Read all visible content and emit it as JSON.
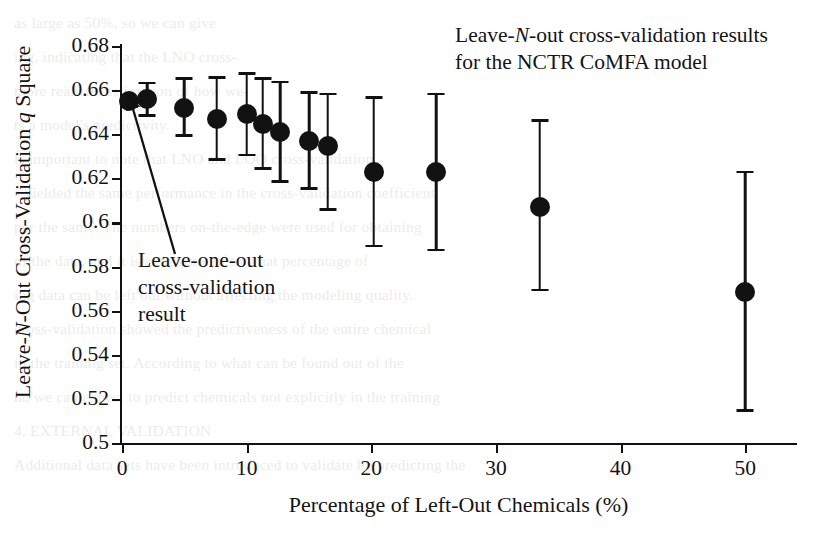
{
  "chart_data": {
    "type": "scatter",
    "title_line1_pre": "Leave-",
    "title_line1_italic": "N",
    "title_line1_post": "-out cross-validation results",
    "title_line2": "for the NCTR CoMFA model",
    "title": "Leave-N-out cross-validation results for the NCTR CoMFA model",
    "xlabel": "Percentage of Left-Out Chemicals (%)",
    "ylabel_pre": "Leave-",
    "ylabel_italic1": "N",
    "ylabel_mid": "-Out Cross-Validation ",
    "ylabel_italic2": "q",
    "ylabel_post": " Square",
    "ylabel": "Leave-N-Out Cross-Validation q Square",
    "xlim": [
      0,
      54
    ],
    "ylim": [
      0.5,
      0.68
    ],
    "xticks": [
      0,
      10,
      20,
      30,
      40,
      50
    ],
    "xtick_labels": [
      "0",
      "10",
      "20",
      "30",
      "40",
      "50"
    ],
    "yticks": [
      0.5,
      0.52,
      0.54,
      0.56,
      0.58,
      0.6,
      0.62,
      0.64,
      0.66,
      0.68
    ],
    "ytick_labels": [
      "0.5",
      "0.52",
      "0.54",
      "0.56",
      "0.58",
      "0.6",
      "0.62",
      "0.64",
      "0.66",
      "0.68"
    ],
    "grid": false,
    "legend": false,
    "marker_color": "#121212",
    "axis_color": "#111111",
    "x": [
      0.6,
      2.0,
      5.0,
      7.6,
      10.0,
      11.3,
      12.7,
      15.0,
      16.5,
      20.2,
      25.2,
      33.5,
      50.0
    ],
    "y": [
      0.655,
      0.656,
      0.652,
      0.647,
      0.649,
      0.6445,
      0.641,
      0.637,
      0.6345,
      0.6228,
      0.6228,
      0.607,
      0.5685
    ],
    "y_lower": [
      null,
      0.6485,
      0.6395,
      0.6285,
      0.6305,
      0.6245,
      0.6185,
      0.6153,
      0.6058,
      0.5893,
      0.5875,
      0.5693,
      0.5148
    ],
    "y_upper": [
      null,
      0.6632,
      0.6652,
      0.6658,
      0.6676,
      0.6652,
      0.6637,
      0.6588,
      0.6582,
      0.6566,
      0.6582,
      0.6462,
      0.6228
    ],
    "points": [
      {
        "x": 0.6,
        "y": 0.655,
        "lo": null,
        "hi": null,
        "label": "leave-one-out"
      },
      {
        "x": 2.0,
        "y": 0.656,
        "lo": 0.6485,
        "hi": 0.6632,
        "label": "2%"
      },
      {
        "x": 5.0,
        "y": 0.652,
        "lo": 0.6395,
        "hi": 0.6652,
        "label": "5%"
      },
      {
        "x": 7.6,
        "y": 0.647,
        "lo": 0.6285,
        "hi": 0.6658,
        "label": "7.6%"
      },
      {
        "x": 10.0,
        "y": 0.649,
        "lo": 0.6305,
        "hi": 0.6676,
        "label": "10%"
      },
      {
        "x": 11.3,
        "y": 0.6445,
        "lo": 0.6245,
        "hi": 0.6652,
        "label": "11.3%"
      },
      {
        "x": 12.7,
        "y": 0.641,
        "lo": 0.6185,
        "hi": 0.6637,
        "label": "12.7%"
      },
      {
        "x": 15.0,
        "y": 0.637,
        "lo": 0.6153,
        "hi": 0.6588,
        "label": "15%"
      },
      {
        "x": 16.5,
        "y": 0.6345,
        "lo": 0.6058,
        "hi": 0.6582,
        "label": "16.5%"
      },
      {
        "x": 20.2,
        "y": 0.6228,
        "lo": 0.5893,
        "hi": 0.6566,
        "label": "20%"
      },
      {
        "x": 25.2,
        "y": 0.6228,
        "lo": 0.5875,
        "hi": 0.6582,
        "label": "25%"
      },
      {
        "x": 33.5,
        "y": 0.607,
        "lo": 0.5693,
        "hi": 0.6462,
        "label": "33.5%"
      },
      {
        "x": 50.0,
        "y": 0.5685,
        "lo": 0.5148,
        "hi": 0.6228,
        "label": "50%"
      }
    ],
    "annotations": [
      {
        "name": "leave-one-out-callout",
        "line1": "Leave-one-out",
        "line2": "cross-validation",
        "line3": "result",
        "text": "Leave-one-out cross-validation result",
        "points_to_x": 0.6,
        "points_to_y": 0.6485
      }
    ]
  },
  "background_text": [
    "as large as 50%, so we can give",
    "ing, indicating that the LNO cross-",
    "more realistic estimation of how we-",
    "ts a model's predictivity.",
    "is important to note that LNO and LOO cross-validation",
    "s yielded the same performance in the cross-validation coefficient",
    "per the same. The numbers on-the-edge were used for obtaining",
    "of the data, and it is a measure of to what percentage of",
    "ing data can be left out without affecting the modeling quality.",
    "cross-validation showed the predictiveness of the entire chemical",
    "in the training set. According to what can be found out of the",
    "ta, we can expect to predict chemicals not explicitly in the training",
    "4.  EXTERNAL VALIDATION",
    "Additional data sets have been introduced to validate by predicting the"
  ]
}
